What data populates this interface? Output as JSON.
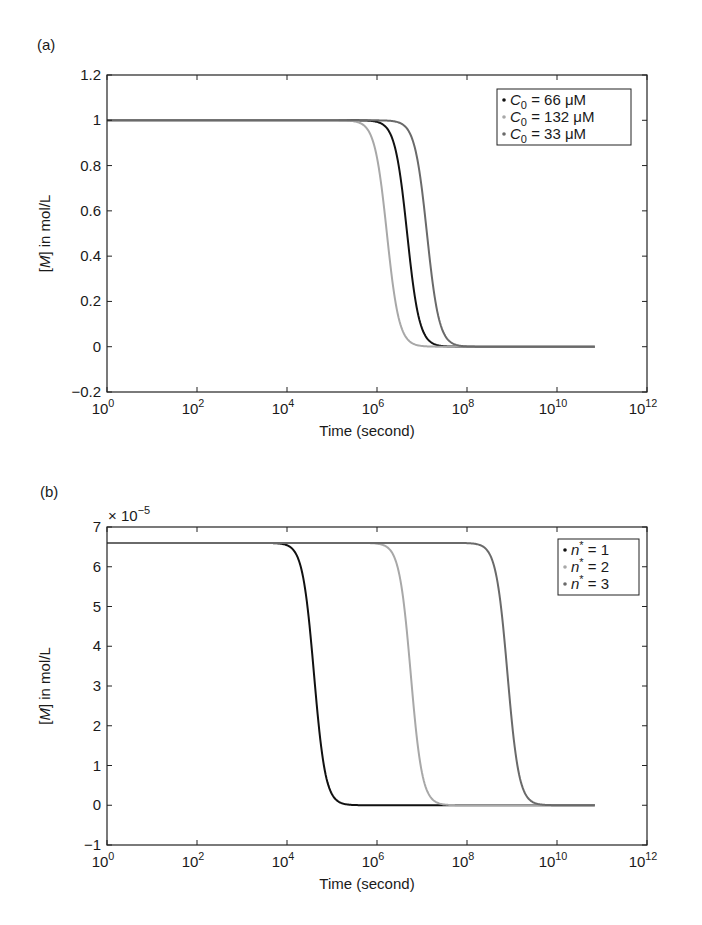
{
  "chart_data": [
    {
      "panel": "(a)",
      "type": "line",
      "xscale": "log",
      "xlabel": "Time (second)",
      "ylabel": "[M] in mol/L",
      "ylabel_italic_part": "M",
      "xlim": [
        1,
        1000000000000.0
      ],
      "ylim": [
        -0.2,
        1.2
      ],
      "x_ticks": [
        "10^0",
        "10^2",
        "10^4",
        "10^6",
        "10^8",
        "10^10",
        "10^12"
      ],
      "x_tick_exponents": [
        0,
        2,
        4,
        6,
        8,
        10,
        12
      ],
      "y_ticks": [
        -0.2,
        0,
        0.2,
        0.4,
        0.6,
        0.8,
        1,
        1.2
      ],
      "y_tick_labels": [
        "−0.2",
        "0",
        "0.2",
        "0.4",
        "0.6",
        "0.8",
        "1",
        "1.2"
      ],
      "legend_position": "upper right",
      "grid": false,
      "series": [
        {
          "name": "C0 = 66 μM",
          "var": "C",
          "sub": "0",
          "rest": " = 66 μM",
          "color": "#111111",
          "plateau": 1.0,
          "log_t_half": 6.67,
          "steepness": 3.2,
          "log_t_end": 10.85
        },
        {
          "name": "C0 = 132 μM",
          "var": "C",
          "sub": "0",
          "rest": " = 132 μM",
          "color": "#a8a8a8",
          "plateau": 1.0,
          "log_t_half": 6.22,
          "steepness": 3.2,
          "log_t_end": 10.85
        },
        {
          "name": "C0 = 33 μM",
          "var": "C",
          "sub": "0",
          "rest": " = 33 μM",
          "color": "#6a6a6a",
          "plateau": 1.0,
          "log_t_half": 7.11,
          "steepness": 3.2,
          "log_t_end": 10.85
        }
      ]
    },
    {
      "panel": "(b)",
      "type": "line",
      "xscale": "log",
      "xlabel": "Time (second)",
      "ylabel": "[M] in mol/L",
      "ylabel_italic_part": "M",
      "y_multiplier": "× 10^−5",
      "xlim": [
        1,
        1000000000000.0
      ],
      "ylim": [
        -1,
        7
      ],
      "x_ticks": [
        "10^0",
        "10^2",
        "10^4",
        "10^6",
        "10^8",
        "10^10",
        "10^12"
      ],
      "x_tick_exponents": [
        0,
        2,
        4,
        6,
        8,
        10,
        12
      ],
      "y_ticks": [
        -1,
        0,
        1,
        2,
        3,
        4,
        5,
        6,
        7
      ],
      "y_tick_labels": [
        "−1",
        "0",
        "1",
        "2",
        "3",
        "4",
        "5",
        "6",
        "7"
      ],
      "legend_position": "upper right",
      "grid": false,
      "series": [
        {
          "name": "n* = 1",
          "var": "n",
          "sup": "*",
          "rest": " = 1",
          "color": "#111111",
          "plateau": 6.6,
          "log_t_half": 4.6,
          "steepness": 3.4,
          "log_t_end": 10.85
        },
        {
          "name": "n* = 2",
          "var": "n",
          "sup": "*",
          "rest": " = 2",
          "color": "#a8a8a8",
          "plateau": 6.6,
          "log_t_half": 6.75,
          "steepness": 3.4,
          "log_t_end": 10.85
        },
        {
          "name": "n* = 3",
          "var": "n",
          "sup": "*",
          "rest": " = 3",
          "color": "#6a6a6a",
          "plateau": 6.6,
          "log_t_half": 8.9,
          "steepness": 3.4,
          "log_t_end": 10.85
        }
      ]
    }
  ],
  "panels": {
    "a": {
      "label": "(a)"
    },
    "b": {
      "label": "(b)"
    }
  }
}
